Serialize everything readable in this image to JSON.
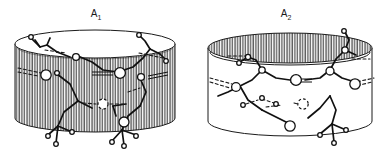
{
  "figure": {
    "title": "",
    "background_color": "#ffffff",
    "ink_color": "#1a1a1a",
    "hatch_color": "#3a3a3a",
    "width": 386,
    "height": 158
  },
  "panels": [
    {
      "id": "A1",
      "label_main": "A",
      "label_sub": "1",
      "label_text": "A1",
      "label_x": 96,
      "label_y": 17,
      "shading": "body-hatched",
      "top_face_fill": "#ffffff",
      "body_fill": "hatched-vertical-lines",
      "cylinder": {
        "cx": 95,
        "top_cy": 44,
        "bottom_cy": 118,
        "rx": 80,
        "ry": 14
      },
      "description": "Cylinder with white top ellipse and vertically hatched side wall; macrocyclic molecular framework drawn across the wall."
    },
    {
      "id": "A2",
      "label_main": "A",
      "label_sub": "2",
      "label_text": "A2",
      "label_x": 286,
      "label_y": 17,
      "shading": "top-hatched",
      "top_face_fill": "hatched-vertical-lines",
      "body_fill": "#ffffff",
      "cylinder": {
        "cx": 290,
        "top_cy": 48,
        "bottom_cy": 121,
        "rx": 82,
        "ry": 15
      },
      "description": "Cylinder with vertically hatched top ellipse and white side wall; macrocyclic molecular framework drawn across the wall."
    }
  ],
  "legend": {
    "atom_large_circle": "open-circle-large",
    "atom_small_circle": "open-circle-small",
    "bond_solid": "solid-line-bond",
    "bond_dashed": "dashed-hydrogen-bond",
    "bond_double": "double-line-bond"
  },
  "icons": {
    "cylinder": "cylinder-icon",
    "atom": "atom-circle-icon",
    "bond": "bond-line-icon",
    "hydrogen_bond": "dashed-bond-icon"
  }
}
